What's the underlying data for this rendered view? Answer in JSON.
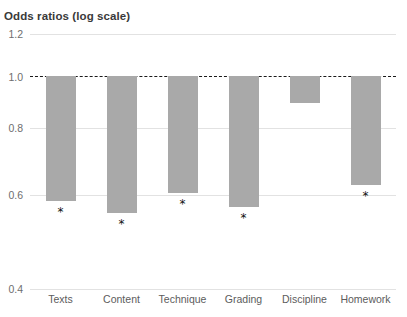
{
  "chart_data": {
    "type": "bar",
    "title": "Odds ratios (log scale)",
    "xlabel": "",
    "ylabel": "",
    "scale": "log",
    "grid": true,
    "legend": "none",
    "ylim": [
      0.4,
      1.2
    ],
    "yticks": [
      "1.2",
      "1.0",
      "0.8",
      "0.6",
      "0.4"
    ],
    "ytick_values": [
      1.2,
      1.0,
      0.8,
      0.6,
      0.4
    ],
    "reference_line": {
      "value": 1.0,
      "style": "dashed",
      "color": "#1a1a1a"
    },
    "bar_color": "#a9a9a9",
    "categories": [
      "Texts",
      "Content",
      "Technique",
      "Grading",
      "Discipline",
      "Homework"
    ],
    "values": [
      0.585,
      0.555,
      0.605,
      0.57,
      0.89,
      0.625
    ],
    "significance_markers": [
      "*",
      "*",
      "*",
      "*",
      "",
      "*"
    ],
    "bars": [
      {
        "label": "Texts",
        "value": 0.585,
        "significant": "*"
      },
      {
        "label": "Content",
        "value": 0.555,
        "significant": "*"
      },
      {
        "label": "Technique",
        "value": 0.605,
        "significant": "*"
      },
      {
        "label": "Grading",
        "value": 0.57,
        "significant": "*"
      },
      {
        "label": "Discipline",
        "value": 0.89,
        "significant": ""
      },
      {
        "label": "Homework",
        "value": 0.625,
        "significant": "*"
      }
    ]
  }
}
